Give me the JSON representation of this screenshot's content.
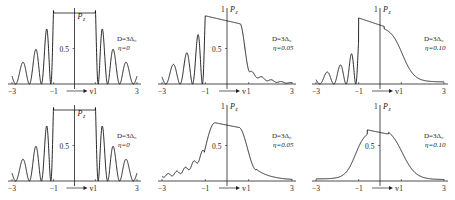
{
  "figure": {
    "ylabel": "P",
    "ylabel_sub": "z",
    "xlabel": "v",
    "xticks": [
      "−3",
      "−1",
      "1",
      "3"
    ],
    "ytick_mid": "0.5",
    "ytick_top": "1"
  },
  "chart_data": [
    {
      "type": "line",
      "title": "",
      "param_D": "D=3Δ₀",
      "param_eta": "η=0",
      "row": 1,
      "col": 1,
      "xlabel": "v",
      "ylabel": "P_z",
      "xlim": [
        -3,
        3
      ],
      "ylim": [
        0,
        1
      ],
      "xticks": [
        -3,
        -1,
        1,
        3
      ],
      "yticks": [
        0.5
      ],
      "description": "Flat plateau at ~1 for |v|<1, oscillating decaying fringes outside (symmetric)",
      "grid": false
    },
    {
      "type": "line",
      "title": "",
      "param_D": "D=3Δ₀",
      "param_eta": "η=0.05",
      "row": 1,
      "col": 2,
      "xlabel": "v",
      "ylabel": "P_z",
      "xlim": [
        -3,
        3
      ],
      "ylim": [
        0,
        1
      ],
      "xticks": [
        -3,
        -1,
        1,
        3
      ],
      "yticks": [
        0.5
      ],
      "yticks_top": [
        1
      ],
      "description": "Sharp jump at v=-1 to ~0.96, slow decline to ~0.85 near v=0.5, steep drop to ~0.15 at v≈1, small oscillations decaying to 0 at v=3; oscillating fringes for v<-1",
      "grid": false
    },
    {
      "type": "line",
      "title": "",
      "param_D": "D=3Δ₀",
      "param_eta": "η=0.10",
      "row": 1,
      "col": 3,
      "xlabel": "v",
      "ylabel": "P_z",
      "xlim": [
        -3,
        3
      ],
      "ylim": [
        0,
        1
      ],
      "xticks": [
        -3,
        -1,
        1,
        3
      ],
      "yticks": [],
      "yticks_top": [
        1
      ],
      "description": "Jump at v=-1 to ~0.93, linear decline to ~0.8 at v=0, smooth sigmoid fall to ~0.1 at v≈2, tail to ~0.04 at v=3",
      "grid": false
    },
    {
      "type": "line",
      "title": "",
      "param_D": "D=3Δ₀",
      "param_eta": "η=0",
      "row": 2,
      "col": 1,
      "xlabel": "v",
      "ylabel": "P_z",
      "xlim": [
        -3,
        3
      ],
      "ylim": [
        0,
        1
      ],
      "xticks": [
        -3,
        -1,
        1,
        3
      ],
      "yticks": [
        0.5
      ],
      "description": "Identical to row 1 col 1: flat plateau for |v|<1 with symmetric fringes",
      "grid": false
    },
    {
      "type": "line",
      "title": "",
      "param_D": "D=3Δ₀",
      "param_eta": "η=0.05",
      "row": 2,
      "col": 2,
      "xlabel": "v",
      "ylabel": "P_z",
      "xlim": [
        -3,
        3
      ],
      "ylim": [
        0,
        1
      ],
      "xticks": [
        -3,
        -1,
        1,
        3
      ],
      "yticks": [
        0.5
      ],
      "yticks_top": [
        1
      ],
      "description": "Smoothed: rises from fringes near v=-1 to ~0.82 peak at v≈-0.5, declines to ~0.78 at v=0, drops to ~0.15 at v≈1.2, tail to 0 at v=3",
      "grid": false
    },
    {
      "type": "line",
      "title": "",
      "param_D": "D=3Δ₀",
      "param_eta": "η=0.10",
      "row": 2,
      "col": 3,
      "xlabel": "v",
      "ylabel": "P_z",
      "xlim": [
        -3,
        3
      ],
      "ylim": [
        0,
        1
      ],
      "xticks": [
        -3,
        -1,
        1,
        3
      ],
      "yticks": [
        0.5
      ],
      "yticks_top": [
        1
      ],
      "description": "Smooth bell: ~0.03 at v=-3, rises to ~0.72 peak at v≈-0.6, ~0.68 at v=0, falls to ~0.1 at v≈2, ~0.02 at v=3",
      "grid": false
    }
  ]
}
